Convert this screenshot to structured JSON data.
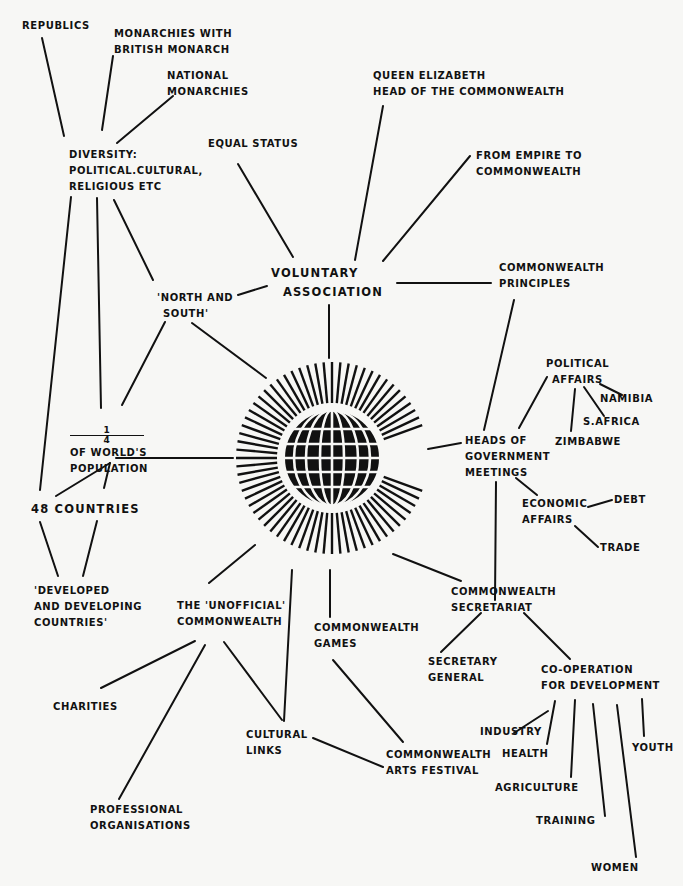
{
  "diagram": {
    "type": "mind-map",
    "center": {
      "icon": "commonwealth-globe-emblem"
    },
    "nodes": {
      "republics": {
        "lines": [
          "REPUBLICS"
        ]
      },
      "monarchies_british": {
        "lines": [
          "MONARCHIES WITH",
          "BRITISH MONARCH"
        ]
      },
      "national_monarchies": {
        "lines": [
          "NATIONAL",
          "MONARCHIES"
        ]
      },
      "diversity": {
        "lines": [
          "DIVERSITY:",
          "POLITICAL.CULTURAL,",
          "RELIGIOUS ETC"
        ]
      },
      "equal_status": {
        "lines": [
          "EQUAL STATUS"
        ]
      },
      "queen": {
        "lines": [
          "QUEEN ELIZABETH",
          "HEAD OF THE COMMONWEALTH"
        ]
      },
      "empire": {
        "lines": [
          "FROM EMPIRE TO",
          "COMMONWEALTH"
        ]
      },
      "voluntary": {
        "lines": [
          "VOLUNTARY",
          "ASSOCIATION"
        ]
      },
      "north_south": {
        "lines": [
          "'NORTH AND",
          "SOUTH'"
        ]
      },
      "principles": {
        "lines": [
          "COMMONWEALTH",
          "PRINCIPLES"
        ]
      },
      "political_affairs": {
        "lines": [
          "POLITICAL",
          "AFFAIRS"
        ]
      },
      "namibia": {
        "lines": [
          "NAMIBIA"
        ]
      },
      "s_africa": {
        "lines": [
          "S.AFRICA"
        ]
      },
      "zimbabwe": {
        "lines": [
          "ZIMBABWE"
        ]
      },
      "heads_of_govt": {
        "lines": [
          "HEADS OF",
          "GOVERNMENT",
          "MEETINGS"
        ]
      },
      "economic_affairs": {
        "lines": [
          "ECONOMIC",
          "AFFAIRS"
        ]
      },
      "debt": {
        "lines": [
          "DEBT"
        ]
      },
      "trade": {
        "lines": [
          "TRADE"
        ]
      },
      "population": {
        "fraction_num": "1",
        "fraction_den": "4",
        "lines": [
          "OF WORLD'S",
          "POPULATION"
        ]
      },
      "countries": {
        "lines": [
          "48 COUNTRIES"
        ]
      },
      "developed": {
        "lines": [
          "'DEVELOPED",
          "AND DEVELOPING",
          "COUNTRIES'"
        ]
      },
      "unofficial": {
        "lines": [
          "THE 'UNOFFICIAL'",
          "COMMONWEALTH"
        ]
      },
      "games": {
        "lines": [
          "COMMONWEALTH",
          "GAMES"
        ]
      },
      "secretariat": {
        "lines": [
          "COMMONWEALTH",
          "SECRETARIAT"
        ]
      },
      "secretary_general": {
        "lines": [
          "SECRETARY",
          "GENERAL"
        ]
      },
      "cooperation": {
        "lines": [
          "CO-OPERATION",
          "FOR DEVELOPMENT"
        ]
      },
      "charities": {
        "lines": [
          "CHARITIES"
        ]
      },
      "cultural_links": {
        "lines": [
          "CULTURAL",
          "LINKS"
        ]
      },
      "arts_festival": {
        "lines": [
          "COMMONWEALTH",
          "ARTS FESTIVAL"
        ]
      },
      "professional": {
        "lines": [
          "PROFESSIONAL",
          "ORGANISATIONS"
        ]
      },
      "industry": {
        "lines": [
          "INDUSTRY"
        ]
      },
      "health": {
        "lines": [
          "HEALTH"
        ]
      },
      "agriculture": {
        "lines": [
          "AGRICULTURE"
        ]
      },
      "training": {
        "lines": [
          "TRAINING"
        ]
      },
      "women": {
        "lines": [
          "WOMEN"
        ]
      },
      "youth": {
        "lines": [
          "YOUTH"
        ]
      }
    },
    "colors": {
      "ink": "#111111",
      "paper": "#f7f7f5"
    }
  }
}
